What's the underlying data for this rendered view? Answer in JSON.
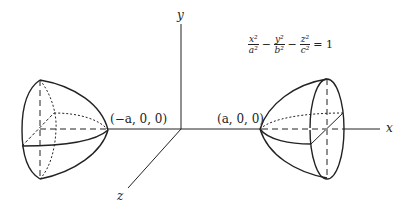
{
  "diagram": {
    "equation": {
      "terms": [
        {
          "num": "x²",
          "den": "a²"
        },
        {
          "op": "−"
        },
        {
          "num": "y²",
          "den": "b²"
        },
        {
          "op": "−"
        },
        {
          "num": "z²",
          "den": "c²"
        }
      ],
      "rhs": "= 1"
    },
    "axes": {
      "x": "x",
      "y": "y",
      "z": "z"
    },
    "points": {
      "left_vertex": "(−a, 0, 0)",
      "right_vertex": "(a, 0, 0)"
    },
    "colors": {
      "stroke": "#222222",
      "background": "#ffffff"
    }
  }
}
